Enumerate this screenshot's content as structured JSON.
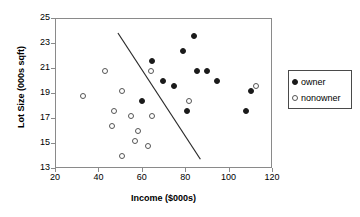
{
  "chart_data": {
    "type": "scatter",
    "title": "",
    "xlabel": "Income ($000s)",
    "ylabel": "Lot Size (000s sqft)",
    "xlim": [
      20,
      120
    ],
    "ylim": [
      13,
      25
    ],
    "xticks": [
      20,
      40,
      60,
      80,
      100,
      120
    ],
    "yticks": [
      13,
      15,
      17,
      19,
      21,
      23,
      25
    ],
    "grid": false,
    "legend_position": "right-outside",
    "series": [
      {
        "name": "owner",
        "marker": "filled-circle",
        "color": "#1a1a1a",
        "points": [
          {
            "x": 60.0,
            "y": 18.4
          },
          {
            "x": 64.8,
            "y": 21.6
          },
          {
            "x": 75.0,
            "y": 19.6
          },
          {
            "x": 85.5,
            "y": 20.8
          },
          {
            "x": 84.0,
            "y": 23.6
          },
          {
            "x": 79.2,
            "y": 22.4
          },
          {
            "x": 94.8,
            "y": 20.0
          },
          {
            "x": 81.0,
            "y": 17.6
          },
          {
            "x": 90.0,
            "y": 20.8
          },
          {
            "x": 110.4,
            "y": 19.2
          },
          {
            "x": 108.0,
            "y": 17.6
          },
          {
            "x": 69.6,
            "y": 20.0
          }
        ]
      },
      {
        "name": "nonowner",
        "marker": "open-circle",
        "color": "#555555",
        "points": [
          {
            "x": 33.0,
            "y": 18.8
          },
          {
            "x": 43.2,
            "y": 20.8
          },
          {
            "x": 47.4,
            "y": 17.6
          },
          {
            "x": 46.2,
            "y": 16.4
          },
          {
            "x": 51.0,
            "y": 14.0
          },
          {
            "x": 58.2,
            "y": 16.0
          },
          {
            "x": 55.2,
            "y": 17.2
          },
          {
            "x": 63.0,
            "y": 14.8
          },
          {
            "x": 64.8,
            "y": 17.2
          },
          {
            "x": 64.2,
            "y": 20.8
          },
          {
            "x": 51.0,
            "y": 19.2
          },
          {
            "x": 81.6,
            "y": 18.4
          },
          {
            "x": 112.8,
            "y": 19.6
          },
          {
            "x": 57.0,
            "y": 15.2
          }
        ]
      }
    ],
    "annotations": [
      {
        "type": "line",
        "name": "discriminant-line",
        "x1": 49.0,
        "y1": 23.8,
        "x2": 87.0,
        "y2": 13.7
      }
    ]
  },
  "legend": {
    "entries": [
      {
        "label": "owner",
        "marker": "filled-circle"
      },
      {
        "label": "nonowner",
        "marker": "open-circle"
      }
    ]
  }
}
